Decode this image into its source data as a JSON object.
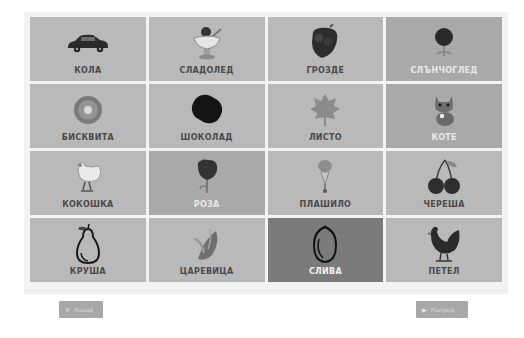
{
  "grid": {
    "tiles": [
      {
        "label": "КОЛА",
        "icon": "car-icon"
      },
      {
        "label": "СЛАДОЛЕД",
        "icon": "ice-cream-icon"
      },
      {
        "label": "ГРОЗДЕ",
        "icon": "grapes-icon"
      },
      {
        "label": "СЛЪНЧОГЛЕД",
        "icon": "sunflower-icon"
      },
      {
        "label": "БИСКВИТА",
        "icon": "cookie-icon"
      },
      {
        "label": "ШОКОЛАД",
        "icon": "chocolate-icon"
      },
      {
        "label": "ЛИСТО",
        "icon": "leaf-icon"
      },
      {
        "label": "КОТЕ",
        "icon": "kitten-icon"
      },
      {
        "label": "КОКОШКА",
        "icon": "hen-icon"
      },
      {
        "label": "РОЗА",
        "icon": "rose-icon"
      },
      {
        "label": "ПЛАШИЛО",
        "icon": "scarecrow-icon"
      },
      {
        "label": "ЧЕРЕША",
        "icon": "cherry-icon"
      },
      {
        "label": "КРУША",
        "icon": "pear-icon"
      },
      {
        "label": "ЦАРЕВИЦА",
        "icon": "corn-icon"
      },
      {
        "label": "СЛИВА",
        "icon": "plum-icon"
      },
      {
        "label": "ПЕТЕЛ",
        "icon": "rooster-icon"
      }
    ],
    "selected_index": 14
  },
  "nav": {
    "back_label": "Назад",
    "back_icon": "✕",
    "next_label": "Напред",
    "next_icon": "▶"
  }
}
